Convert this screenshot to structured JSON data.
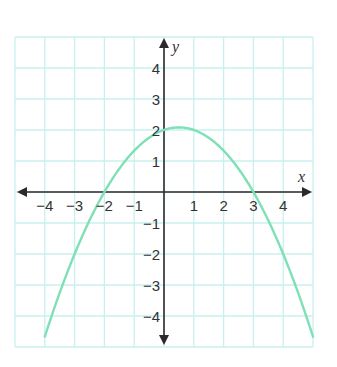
{
  "chart_data": {
    "type": "line",
    "title": "",
    "xlabel": "x",
    "ylabel": "y",
    "xlim": [
      -5,
      5
    ],
    "ylim": [
      -5,
      5
    ],
    "grid": true,
    "x_ticks": [
      -4,
      -3,
      -2,
      -1,
      1,
      2,
      3,
      4
    ],
    "x_tick_labels": [
      "−4",
      "−3",
      "−2",
      "−1",
      "1",
      "2",
      "3",
      "4"
    ],
    "y_ticks": [
      4,
      3,
      2,
      1,
      -1,
      -2,
      -3,
      -4
    ],
    "y_tick_labels": [
      "4",
      "3",
      "2",
      "1",
      "−1",
      "−2",
      "−3",
      "−4"
    ],
    "series": [
      {
        "name": "parabola",
        "equation": "y = -(x + 2)(x - 3) / 3",
        "color": "#7ee0b4",
        "x_range": [
          -4.0,
          5.0
        ],
        "key_points": {
          "vertex": [
            0.5,
            2.08
          ],
          "y_intercept": [
            0,
            2
          ],
          "x_intercepts": [
            [
              -2,
              0
            ],
            [
              3,
              0
            ]
          ]
        },
        "x": [
          -4,
          -3,
          -2,
          -1,
          0,
          0.5,
          1,
          2,
          3,
          4,
          5
        ],
        "y": [
          -4.67,
          -2.0,
          0,
          1.33,
          2.0,
          2.08,
          2.0,
          1.33,
          0,
          -2.0,
          -4.67
        ]
      }
    ],
    "colors": {
      "grid": "#c8f0ee",
      "axis": "#2a2a2a",
      "curve": "#7ee0b4"
    }
  }
}
